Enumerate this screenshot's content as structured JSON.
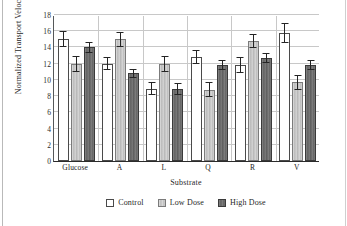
{
  "chart_data": {
    "type": "bar",
    "title": "",
    "xlabel": "Substrate",
    "ylabel": "Normalized Transport Velocity",
    "categories": [
      "Glucose",
      "A",
      "L",
      "Q",
      "R",
      "V"
    ],
    "ylim": [
      0,
      18
    ],
    "yticks": [
      0,
      2,
      4,
      6,
      8,
      10,
      12,
      14,
      16,
      18
    ],
    "ytick_labels": [
      "0",
      "2",
      "4",
      "6",
      "8",
      "10",
      "12",
      "14",
      "16",
      "18"
    ],
    "grid": true,
    "grid_axis": "y",
    "legend_position": "bottom-center",
    "error_bars": "symmetric",
    "series": [
      {
        "name": "Control",
        "color": "#ffffff",
        "edge_color": "#4a4a4a",
        "values": [
          15.0,
          12.0,
          8.9,
          12.8,
          11.8,
          15.8
        ],
        "errors": [
          1.0,
          0.8,
          0.8,
          0.9,
          1.0,
          1.2
        ]
      },
      {
        "name": "Low Dose",
        "color": "#c3c3c3",
        "edge_color": "#7b7b7b",
        "values": [
          12.0,
          15.0,
          12.0,
          8.8,
          14.8,
          9.7
        ],
        "errors": [
          1.0,
          0.9,
          1.0,
          0.9,
          0.9,
          0.9
        ]
      },
      {
        "name": "High Dose",
        "color": "#686868",
        "edge_color": "#3a3a3a",
        "values": [
          14.0,
          10.8,
          8.9,
          11.8,
          12.7,
          11.8
        ],
        "errors": [
          0.7,
          0.6,
          0.7,
          0.6,
          0.6,
          0.6
        ]
      }
    ]
  },
  "legend": {
    "items": [
      {
        "label": "Control"
      },
      {
        "label": "Low Dose"
      },
      {
        "label": "High Dose"
      }
    ]
  }
}
